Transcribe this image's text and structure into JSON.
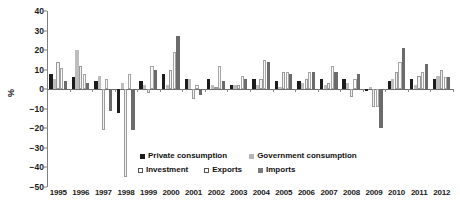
{
  "chart_data": {
    "type": "bar",
    "title": "",
    "xlabel": "",
    "ylabel": "%",
    "ylim": [
      -50,
      40
    ],
    "grid": false,
    "legend_position": "inside-bottom",
    "categories": [
      "1995",
      "1996",
      "1997",
      "1998",
      "1999",
      "2000",
      "2001",
      "2002",
      "2003",
      "2004",
      "2005",
      "2006",
      "2007",
      "2008",
      "2009",
      "2010",
      "2011",
      "2012"
    ],
    "y_ticks": [
      40,
      30,
      20,
      10,
      0,
      -10,
      -20,
      -30,
      -40,
      -50
    ],
    "series": [
      {
        "name": "Private consumption",
        "color": "#1c1c1c",
        "values": [
          8,
          6,
          4,
          -12,
          4,
          8,
          5,
          5,
          2,
          5,
          4,
          4,
          5,
          5,
          -1,
          4,
          5,
          5
        ]
      },
      {
        "name": "Government consumption",
        "color": "#bdbdbd",
        "values": [
          5,
          20,
          7,
          3,
          2,
          2,
          5,
          2,
          2,
          2,
          1,
          3,
          2,
          3,
          1,
          5,
          2,
          7
        ]
      },
      {
        "name": "Investment",
        "color": "#f2f2f2",
        "values": [
          14,
          12,
          -21,
          -45,
          -2,
          10,
          -5,
          1,
          2,
          5,
          9,
          5,
          3,
          -4,
          -9,
          9,
          7,
          10
        ]
      },
      {
        "name": "Exports",
        "color": "#fafafa",
        "values": [
          11,
          8,
          5,
          8,
          12,
          19,
          2,
          12,
          7,
          15,
          9,
          9,
          12,
          5,
          -9,
          14,
          9,
          6
        ]
      },
      {
        "name": "Imports",
        "color": "#6b6b6b",
        "values": [
          4,
          3,
          -11,
          -21,
          10,
          27,
          -3,
          4,
          5,
          14,
          8,
          9,
          9,
          8,
          -20,
          21,
          13,
          6
        ]
      }
    ]
  },
  "legend": {
    "items": [
      {
        "label": "Private consumption",
        "swatch": "s-private"
      },
      {
        "label": "Government consumption",
        "swatch": "s-govt"
      },
      {
        "label": "Investment",
        "swatch": "s-invest"
      },
      {
        "label": "Exports",
        "swatch": "s-exports"
      },
      {
        "label": "Imports",
        "swatch": "s-imports"
      }
    ]
  }
}
